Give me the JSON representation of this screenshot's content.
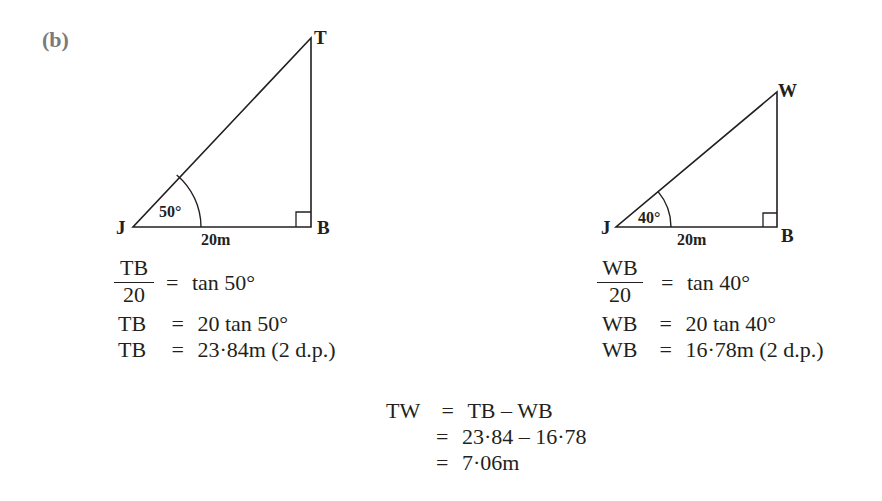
{
  "part_label": "(b)",
  "left_triangle": {
    "vertices": {
      "apex": "T",
      "base_left": "J",
      "base_right": "B"
    },
    "angle_label": "50°",
    "base_label": "20m",
    "right_angle_at": "B",
    "working": {
      "line1": {
        "numerator": "TB",
        "denominator": "20",
        "equals": "=",
        "rhs": "tan 50°"
      },
      "line2": {
        "lhs": "TB",
        "equals": "=",
        "rhs": "20 tan 50°"
      },
      "line3": {
        "lhs": "TB",
        "equals": "=",
        "rhs": "23·84m (2 d.p.)"
      }
    }
  },
  "right_triangle": {
    "vertices": {
      "apex": "W",
      "base_left": "J",
      "base_right": "B"
    },
    "angle_label": "40°",
    "base_label": "20m",
    "right_angle_at": "B",
    "working": {
      "line1": {
        "numerator": "WB",
        "denominator": "20",
        "equals": "=",
        "rhs": "tan 40°"
      },
      "line2": {
        "lhs": "WB",
        "equals": "=",
        "rhs": "20 tan 40°"
      },
      "line3": {
        "lhs": "WB",
        "equals": "=",
        "rhs": "16·78m (2 d.p.)"
      }
    }
  },
  "final_working": {
    "line1": {
      "lhs": "TW",
      "equals": "=",
      "rhs": "TB – WB"
    },
    "line2": {
      "equals": "=",
      "rhs": "23·84 – 16·78"
    },
    "line3": {
      "equals": "=",
      "rhs": "7·06m"
    }
  }
}
